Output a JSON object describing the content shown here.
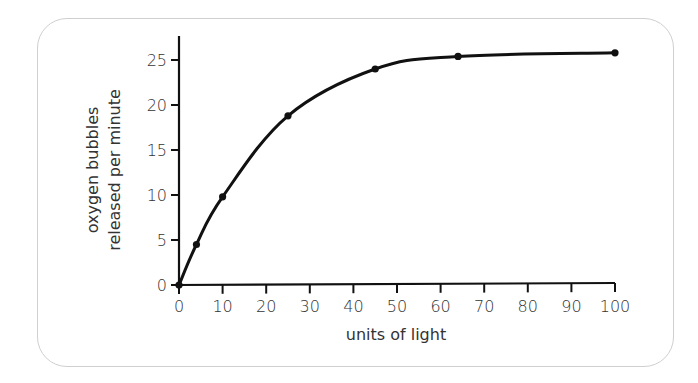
{
  "chart_data": {
    "type": "line",
    "title": "",
    "xlabel": "units of light",
    "ylabel": [
      "oxygen bubbles",
      "released per minute"
    ],
    "xlim": [
      0,
      100
    ],
    "ylim": [
      0,
      25
    ],
    "xticks": [
      0,
      10,
      20,
      30,
      40,
      50,
      60,
      70,
      80,
      90,
      100
    ],
    "yticks": [
      0,
      5,
      10,
      15,
      20,
      25
    ],
    "grid": false,
    "legend": null,
    "series": [
      {
        "name": "oxygen bubbles released per minute",
        "x": [
          0,
          4,
          10,
          25,
          45,
          64,
          100
        ],
        "y": [
          0,
          4.5,
          9.8,
          18.8,
          24.0,
          25.4,
          25.8
        ],
        "color": "#111111",
        "markers": true
      }
    ]
  }
}
